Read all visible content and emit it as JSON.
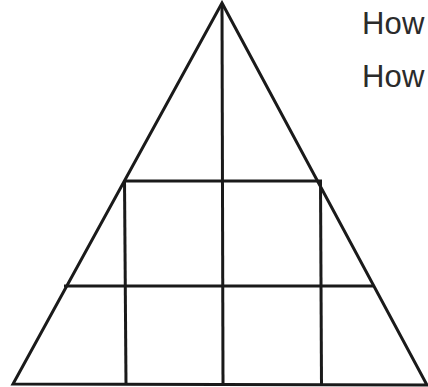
{
  "page": {
    "background_color": "#ffffff",
    "width": 428,
    "height": 387
  },
  "figure": {
    "name": "triangle-grid-diagram",
    "stroke_color": "#1a1a1a",
    "fill_color": "#ffffff",
    "outline_stroke_width": 3,
    "grid_stroke_width": 3,
    "triangle": {
      "apex": [
        222,
        3
      ],
      "bottom_left": [
        13,
        384
      ],
      "bottom_right": [
        427,
        385
      ]
    },
    "grid_lines": {
      "horizontal": [
        {
          "label": "upper-horizontal",
          "x1": 124,
          "y1": 181,
          "x2": 322,
          "y2": 181
        },
        {
          "label": "lower-horizontal",
          "x1": 65,
          "y1": 286,
          "x2": 372,
          "y2": 286
        }
      ],
      "vertical": [
        {
          "label": "left-vertical",
          "x1": 124,
          "y1": 181,
          "x2": 126,
          "y2": 385
        },
        {
          "label": "center-vertical",
          "x1": 222,
          "y1": 4,
          "x2": 223,
          "y2": 385
        },
        {
          "label": "right-vertical",
          "x1": 320,
          "y1": 181,
          "x2": 321,
          "y2": 385
        }
      ]
    }
  },
  "annotations": {
    "lines": [
      {
        "id": "line-1",
        "text": "How"
      },
      {
        "id": "line-2",
        "text": "How"
      }
    ],
    "text_color": "#2b2b2b",
    "font_size_px": 31
  }
}
